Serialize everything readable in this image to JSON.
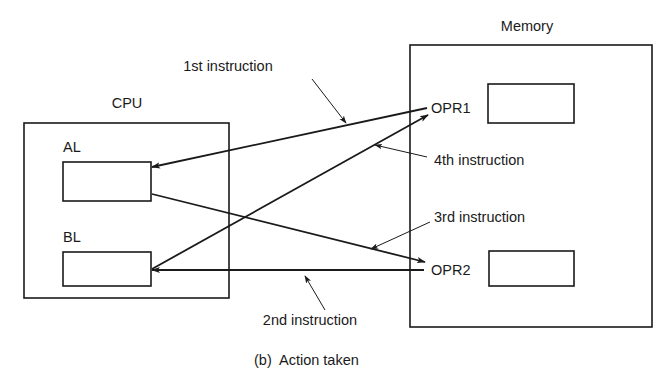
{
  "caption": "(b)  Action taken",
  "cpu": {
    "title": "CPU",
    "registers": [
      {
        "id": "al",
        "label": "AL"
      },
      {
        "id": "bl",
        "label": "BL"
      }
    ]
  },
  "memory": {
    "title": "Memory",
    "locations": [
      {
        "id": "opr1",
        "label": "OPR1"
      },
      {
        "id": "opr2",
        "label": "OPR2"
      }
    ]
  },
  "instructions": [
    {
      "order": 1,
      "label": "1st instruction",
      "from": "OPR1",
      "to": "AL"
    },
    {
      "order": 2,
      "label": "2nd instruction",
      "from": "OPR2",
      "to": "BL"
    },
    {
      "order": 3,
      "label": "3rd instruction",
      "from": "AL",
      "to": "OPR2"
    },
    {
      "order": 4,
      "label": "4th instruction",
      "from": "BL",
      "to": "OPR1"
    }
  ]
}
